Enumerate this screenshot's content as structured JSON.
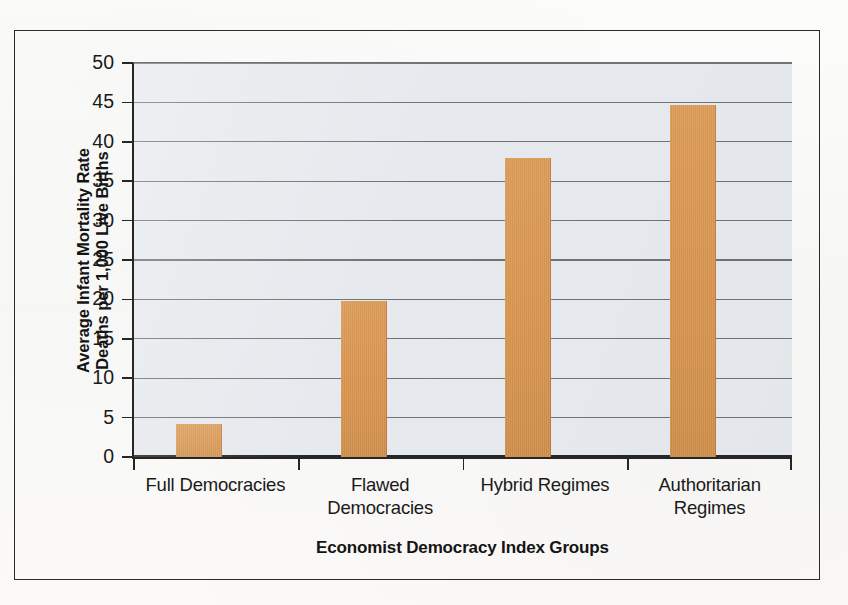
{
  "chart_data": {
    "type": "bar",
    "title": "",
    "categories": [
      "Full Democracies",
      "Flawed Democracies",
      "Hybrid Regimes",
      "Authoritarian Regimes"
    ],
    "category_lines": [
      [
        "Full Democracies"
      ],
      [
        "Flawed",
        "Democracies"
      ],
      [
        "Hybrid Regimes"
      ],
      [
        "Authoritarian",
        "Regimes"
      ]
    ],
    "values": [
      4.2,
      19.8,
      37.9,
      44.7
    ],
    "xlabel": "Economist Democracy Index Groups",
    "ylabel": "Average Infant Mortality Rate Deaths per 1,000 Live Births",
    "ylabel_lines": [
      "Average Infant Mortality Rate",
      "Deaths per 1,000 Live Births"
    ],
    "ylim": [
      0,
      50
    ],
    "ytick_step": 5,
    "yticks": [
      0,
      5,
      10,
      15,
      20,
      25,
      30,
      35,
      40,
      45,
      50
    ],
    "ytick_labels": [
      "0",
      "5",
      "10",
      "15",
      "20",
      "25",
      "30",
      "35",
      "40",
      "45",
      "50"
    ],
    "grid": true,
    "legend": false,
    "legend_position": "none",
    "bar_color": "#d9954f",
    "plot_background_color": "#e6e9ed",
    "gridline_color": "#6f7276",
    "axis_color": "#262626",
    "text_color": "#141414",
    "page_background_color": "#fbfbfa"
  }
}
